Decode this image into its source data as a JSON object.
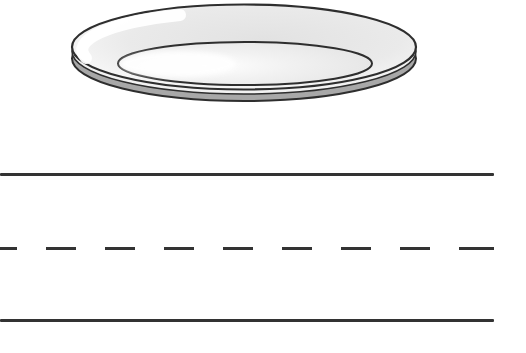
{
  "page": {
    "kind": "handwriting practice worksheet",
    "width_px": 526,
    "height_px": 353,
    "background_color": "#ffffff"
  },
  "illustration": {
    "name": "plate",
    "alt_text": "Empty oval dinner plate shown at an angle",
    "outline_color": "#2e2e2e",
    "surface_color": "#e6e6e6",
    "highlight_color": "#ffffff",
    "side_edge_color": "#a8a8a8"
  },
  "writing_lines": {
    "line_color": "#333333",
    "line_length_px": 494,
    "line_thickness_px": 3,
    "rows": [
      {
        "style": "solid",
        "y_px": 173
      },
      {
        "style": "dashed",
        "y_px": 247,
        "dash_px": 30,
        "gap_px": 29
      },
      {
        "style": "solid",
        "y_px": 319
      }
    ]
  }
}
